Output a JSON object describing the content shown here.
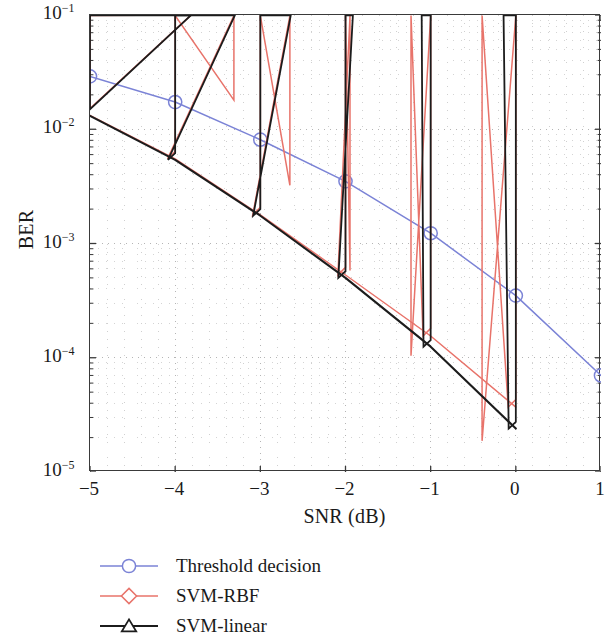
{
  "chart_data": {
    "type": "line",
    "title": "",
    "xlabel": "SNR (dB)",
    "ylabel": "BER",
    "xlim": [
      -5,
      1
    ],
    "ylim": [
      1e-05,
      0.1
    ],
    "yscale": "log",
    "xticks": [
      -5,
      -4,
      -3,
      -2,
      -1,
      0,
      1
    ],
    "xticklabels": [
      "−5",
      "−4",
      "−3",
      "−2",
      "−1",
      "0",
      "1"
    ],
    "yticks": [
      0.1,
      0.01,
      0.001,
      0.0001,
      1e-05
    ],
    "yticklabels": [
      "10⁻¹",
      "10⁻²",
      "10⁻³",
      "10⁻⁴",
      "10⁻⁵"
    ],
    "ytick_base": "10",
    "ytick_exponents": [
      "−1",
      "−2",
      "−3",
      "−4",
      "−5"
    ],
    "grid": true,
    "grid_style": "dotted-minor",
    "legend_position": "below-axes-left",
    "x": [
      -5,
      -4,
      -3,
      -2,
      -1,
      0,
      1
    ],
    "series": [
      {
        "name": "Threshold decision",
        "color": "#7b83d6",
        "marker": "circle",
        "x": [
          -5,
          -4,
          -3,
          -2,
          -1,
          0,
          1
        ],
        "values": [
          0.029,
          0.0173,
          0.0081,
          0.0035,
          0.00123,
          0.00035,
          7e-05
        ]
      },
      {
        "name": "SVM-RBF",
        "color": "#e8736a",
        "marker": "diamond",
        "x": [
          -5,
          -4,
          -3,
          -2,
          -1,
          0
        ],
        "values": [
          0.0132,
          0.0055,
          0.00178,
          0.00053,
          0.000155,
          3.7e-05
        ]
      },
      {
        "name": "SVM-linear",
        "color": "#1c1c1c",
        "marker": "triangle",
        "x": [
          -5,
          -4,
          -3,
          -2,
          -1,
          0
        ],
        "values": [
          0.0131,
          0.0054,
          0.00175,
          0.0005,
          0.000125,
          2.4e-05
        ]
      }
    ]
  },
  "legend": {
    "items": [
      {
        "label": "Threshold decision",
        "color": "#7b83d6",
        "marker": "circle"
      },
      {
        "label": "SVM-RBF",
        "color": "#e8736a",
        "marker": "diamond"
      },
      {
        "label": "SVM-linear",
        "color": "#1c1c1c",
        "marker": "triangle"
      }
    ]
  }
}
